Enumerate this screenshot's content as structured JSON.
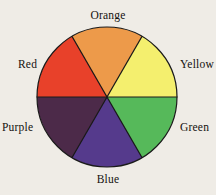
{
  "figure": {
    "background_color": "#efece6",
    "outline_color": "#1a1a1a"
  },
  "chart_data": {
    "type": "pie",
    "xlabel": "",
    "ylabel": "",
    "legend_position": "outside-radial",
    "grid": false,
    "center": {
      "x": 107,
      "y": 97
    },
    "radius": 70,
    "slice_angle_degrees": 60,
    "categories": [
      "Orange",
      "Yellow",
      "Green",
      "Blue",
      "Purple",
      "Red"
    ],
    "values": [
      1,
      1,
      1,
      1,
      1,
      1
    ],
    "labels": [
      "Orange",
      "Yellow",
      "Green",
      "Blue",
      "Purple",
      "Red"
    ],
    "colors": [
      "#ed9a4a",
      "#f4ef6e",
      "#56b95a",
      "#553a8c",
      "#4c2a49",
      "#e8412a"
    ],
    "slices": [
      {
        "label": "Orange",
        "color": "#ed9a4a",
        "start_angle": 60,
        "end_angle": 120,
        "value": 1,
        "percent": 16.7
      },
      {
        "label": "Yellow",
        "color": "#f4ef6e",
        "start_angle": 0,
        "end_angle": 60,
        "value": 1,
        "percent": 16.7
      },
      {
        "label": "Green",
        "color": "#56b95a",
        "start_angle": 300,
        "end_angle": 360,
        "value": 1,
        "percent": 16.7
      },
      {
        "label": "Blue",
        "color": "#553a8c",
        "start_angle": 240,
        "end_angle": 300,
        "value": 1,
        "percent": 16.7
      },
      {
        "label": "Purple",
        "color": "#4c2a49",
        "start_angle": 180,
        "end_angle": 240,
        "value": 1,
        "percent": 16.7
      },
      {
        "label": "Red",
        "color": "#e8412a",
        "start_angle": 120,
        "end_angle": 180,
        "value": 1,
        "percent": 16.7
      }
    ]
  },
  "labels": {
    "orange": "Orange",
    "yellow": "Yellow",
    "green": "Green",
    "blue": "Blue",
    "purple": "Purple",
    "red": "Red"
  }
}
